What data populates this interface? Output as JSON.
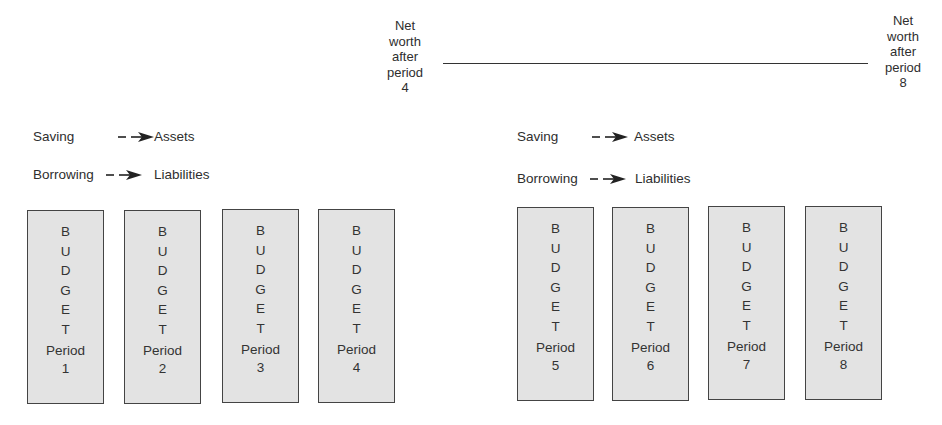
{
  "net_worth_labels": {
    "left": {
      "lines": [
        "Net",
        "worth",
        "after",
        "period",
        "4"
      ]
    },
    "right": {
      "lines": [
        "Net",
        "worth",
        "after",
        "period",
        "8"
      ]
    }
  },
  "flows": {
    "left_group": [
      {
        "source": "Saving",
        "target": "Assets",
        "arrow": "dashed-arrow"
      },
      {
        "source": "Borrowing",
        "target": "Liabilities",
        "arrow": "dashed-arrow"
      }
    ],
    "right_group": [
      {
        "source": "Saving",
        "target": "Assets",
        "arrow": "dashed-arrow"
      },
      {
        "source": "Borrowing",
        "target": "Liabilities",
        "arrow": "dashed-arrow"
      }
    ]
  },
  "budget_word": [
    "B",
    "U",
    "D",
    "G",
    "E",
    "T"
  ],
  "period_label": "Period",
  "boxes": [
    {
      "period": "1"
    },
    {
      "period": "2"
    },
    {
      "period": "3"
    },
    {
      "period": "4"
    },
    {
      "period": "5"
    },
    {
      "period": "6"
    },
    {
      "period": "7"
    },
    {
      "period": "8"
    }
  ],
  "colors": {
    "box_fill": "#e3e3e3",
    "box_border": "#444444",
    "text": "#2e2e2e",
    "line": "#333333"
  }
}
